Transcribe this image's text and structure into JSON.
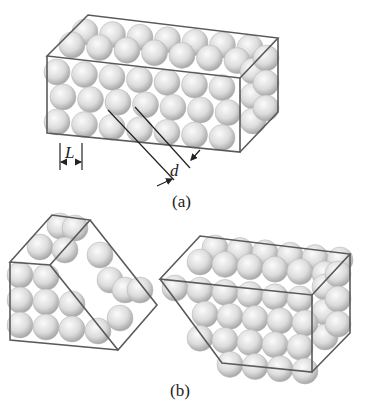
{
  "labels": {
    "length": "L",
    "spacing": "d",
    "panel_a": "(a)",
    "panel_b": "(b)"
  },
  "colors": {
    "sphere_light": "#f2f2f2",
    "sphere_dark": "#a9a9a9",
    "edge": "#5a5a5a",
    "line": "#333333",
    "background": "#ffffff"
  },
  "figure_a": {
    "description": "Rectangular block of close-packed spheres with unit length L and plane spacing d",
    "front_rows": 3,
    "front_cols": 7,
    "depth_layers": 3
  },
  "figure_b": {
    "description": "Two fragments of the crystal cleaved along a diagonal plane",
    "left_fragment": "triangular prism",
    "right_fragment": "truncated block"
  }
}
